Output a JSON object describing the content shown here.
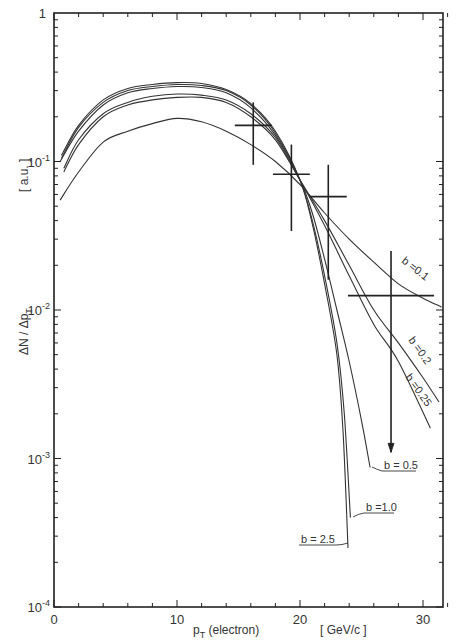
{
  "chart_data": {
    "type": "line",
    "title": "",
    "xlabel": "p_T (electron)",
    "xlabel_unit": "[ GeV/c ]",
    "ylabel": "ΔN / Δp_T",
    "ylabel_unit": "[ a.u. ]",
    "xscale": "linear",
    "yscale": "log",
    "xlim": [
      0,
      32
    ],
    "ylim": [
      0.0001,
      1
    ],
    "x_ticks": [
      {
        "value": 0,
        "label": "0"
      },
      {
        "value": 10,
        "label": "10"
      },
      {
        "value": 20,
        "label": "20"
      },
      {
        "value": 30,
        "label": "30"
      }
    ],
    "y_ticks": [
      {
        "value": 1,
        "label": "1",
        "exp": ""
      },
      {
        "value": 0.1,
        "label": "10",
        "exp": "-1"
      },
      {
        "value": 0.01,
        "label": "10",
        "exp": "-2"
      },
      {
        "value": 0.001,
        "label": "10",
        "exp": "-3"
      },
      {
        "value": 0.0001,
        "label": "10",
        "exp": "-4"
      }
    ],
    "grid": false,
    "legend": "inline labels at curve ends",
    "series": [
      {
        "name": "b=0.1",
        "x": [
          0.5,
          2,
          4,
          6,
          8,
          10,
          12,
          14,
          16,
          18,
          20,
          22,
          24,
          26,
          28,
          30,
          31.5
        ],
        "values": [
          0.055,
          0.085,
          0.135,
          0.16,
          0.18,
          0.195,
          0.185,
          0.16,
          0.13,
          0.1,
          0.07,
          0.045,
          0.03,
          0.021,
          0.015,
          0.012,
          0.0105
        ]
      },
      {
        "name": "b=0.2",
        "x": [
          0.8,
          2,
          4,
          6,
          8,
          10,
          12,
          14,
          16,
          18,
          20,
          22,
          24,
          26,
          28,
          30,
          31.3
        ],
        "values": [
          0.085,
          0.13,
          0.2,
          0.24,
          0.26,
          0.27,
          0.27,
          0.25,
          0.2,
          0.14,
          0.075,
          0.04,
          0.02,
          0.01,
          0.006,
          0.0035,
          0.0024
        ]
      },
      {
        "name": "b=0.25",
        "x": [
          0.8,
          2,
          4,
          6,
          8,
          10,
          12,
          14,
          16,
          18,
          20,
          22,
          24,
          26,
          28,
          30.6
        ],
        "values": [
          0.09,
          0.14,
          0.21,
          0.25,
          0.275,
          0.285,
          0.28,
          0.26,
          0.21,
          0.145,
          0.075,
          0.037,
          0.017,
          0.008,
          0.0045,
          0.0016
        ]
      },
      {
        "name": "b=0.5",
        "x": [
          0.5,
          2,
          4,
          6,
          8,
          10,
          12,
          14,
          16,
          18,
          20,
          21,
          22,
          23,
          24,
          25,
          25.7
        ],
        "values": [
          0.1,
          0.16,
          0.24,
          0.29,
          0.31,
          0.32,
          0.315,
          0.29,
          0.23,
          0.15,
          0.075,
          0.045,
          0.022,
          0.01,
          0.0045,
          0.0018,
          0.00087
        ]
      },
      {
        "name": "b=1.0",
        "x": [
          0.6,
          2,
          4,
          6,
          8,
          10,
          12,
          14,
          16,
          18,
          20,
          21,
          22,
          23,
          23.6,
          24.1
        ],
        "values": [
          0.105,
          0.17,
          0.25,
          0.3,
          0.32,
          0.33,
          0.325,
          0.3,
          0.24,
          0.155,
          0.075,
          0.04,
          0.017,
          0.006,
          0.002,
          0.0004
        ]
      },
      {
        "name": "b=2.5",
        "x": [
          0.6,
          2,
          4,
          6,
          8,
          10,
          12,
          14,
          16,
          18,
          20,
          21,
          22,
          23,
          23.5,
          23.9
        ],
        "values": [
          0.11,
          0.175,
          0.26,
          0.31,
          0.33,
          0.34,
          0.335,
          0.305,
          0.245,
          0.16,
          0.075,
          0.038,
          0.015,
          0.005,
          0.0015,
          0.00025
        ]
      }
    ],
    "data_points": [
      {
        "x": 16.2,
        "y": 0.175,
        "x_err": 1.5,
        "y_low": 0.095,
        "y_high": 0.25,
        "upper_limit": false
      },
      {
        "x": 19.3,
        "y": 0.082,
        "x_err": 1.5,
        "y_low": 0.034,
        "y_high": 0.13,
        "upper_limit": false
      },
      {
        "x": 22.3,
        "y": 0.058,
        "x_err": 1.5,
        "y_low": 0.016,
        "y_high": 0.095,
        "upper_limit": false
      },
      {
        "x": 27.4,
        "y": 0.0125,
        "x_err": 3.5,
        "y_low": 0.0011,
        "y_high": 0.025,
        "upper_limit": true
      }
    ],
    "annotations": [
      {
        "text": "b=0.1",
        "at_series": "b=0.1",
        "style": "rotated along curve"
      },
      {
        "text": "b=0.2",
        "at_series": "b=0.2",
        "style": "rotated along curve"
      },
      {
        "text": "b=0.25",
        "at_series": "b=0.25",
        "style": "rotated along curve"
      },
      {
        "text": "b=0.5",
        "at_series": "b=0.5",
        "style": "underlined with leader"
      },
      {
        "text": "b=1.0",
        "at_series": "b=1.0",
        "style": "underlined with leader"
      },
      {
        "text": "b=2.5",
        "at_series": "b=2.5",
        "style": "underlined with leader"
      }
    ]
  },
  "labels": {
    "xlabel_main": "p",
    "xlabel_sub": "T",
    "xlabel_rest": " (electron)",
    "xlabel_unit": "[ GeV/c ]",
    "ylabel_main": "ΔN / Δp",
    "ylabel_sub": "T",
    "ylabel_unit": "[ a.u. ]",
    "b01": "b =0.1",
    "b02": "b =0.2",
    "b025": "b =0.25",
    "b05": "b = 0.5",
    "b10": "b =1.0",
    "b25": "b = 2.5"
  }
}
